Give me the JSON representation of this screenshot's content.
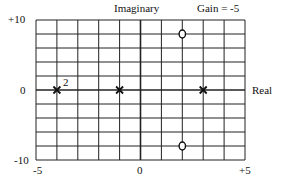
{
  "chart_data": {
    "type": "scatter",
    "title": "Gain = -5",
    "xlabel": "Real",
    "ylabel": "Imaginary",
    "xlim": [
      -5,
      5
    ],
    "ylim": [
      -10,
      10
    ],
    "grid": true,
    "x_grid_step": 1,
    "y_grid_step": 2,
    "x_tick_labels": [
      "-5",
      "0",
      "+5"
    ],
    "y_tick_labels": [
      "+10",
      "0",
      "-10"
    ],
    "series": [
      {
        "name": "poles",
        "marker": "x",
        "points": [
          {
            "x": -4,
            "y": 0,
            "multiplicity": 2,
            "annotation": "2"
          },
          {
            "x": -1,
            "y": 0,
            "multiplicity": 1
          },
          {
            "x": 3,
            "y": 0,
            "multiplicity": 1
          }
        ]
      },
      {
        "name": "zeros",
        "marker": "o",
        "points": [
          {
            "x": 2,
            "y": 8
          },
          {
            "x": 2,
            "y": -8
          }
        ]
      }
    ]
  },
  "labels": {
    "imag_axis": "Imaginary",
    "gain": "Gain = -5",
    "real_axis": "Real",
    "y_top": "+10",
    "y_zero": "0",
    "y_bottom": "-10",
    "x_left": "-5",
    "x_zero": "0",
    "x_right": "+5",
    "multiplicity": "2"
  }
}
